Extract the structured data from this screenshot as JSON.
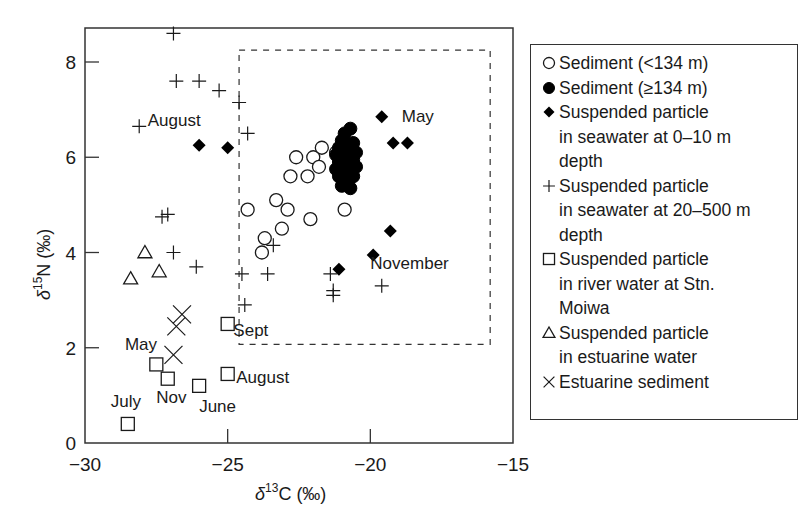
{
  "chart_data": {
    "type": "scatter",
    "title": "",
    "xlabel": "δ13C (‰)",
    "ylabel": "δ15N (‰)",
    "xlim": [
      -30,
      -15
    ],
    "ylim": [
      0,
      8.7
    ],
    "xticks": [
      -30,
      -25,
      -20,
      -15
    ],
    "yticks": [
      0,
      2,
      4,
      6,
      8
    ],
    "grid": false,
    "legend_position": "right, outside plot",
    "highlight_box": {
      "x": [
        -24.6,
        -15.8
      ],
      "y": [
        2.07,
        8.25
      ],
      "style": "dashed"
    },
    "series": [
      {
        "name": "Sediment (<134 m)",
        "marker": "open-circle",
        "points": [
          [
            -22.6,
            6.0
          ],
          [
            -22.0,
            6.0
          ],
          [
            -21.7,
            6.2
          ],
          [
            -21.2,
            6.1
          ],
          [
            -22.8,
            5.6
          ],
          [
            -22.2,
            5.6
          ],
          [
            -21.8,
            5.8
          ],
          [
            -21.0,
            5.9
          ],
          [
            -24.3,
            4.9
          ],
          [
            -23.3,
            5.1
          ],
          [
            -22.9,
            4.9
          ],
          [
            -23.7,
            4.3
          ],
          [
            -23.1,
            4.5
          ],
          [
            -23.8,
            4.0
          ],
          [
            -22.1,
            4.7
          ],
          [
            -20.9,
            4.9
          ]
        ]
      },
      {
        "name": "Sediment (≥134 m)",
        "marker": "filled-circle",
        "points": [
          [
            -20.7,
            6.6
          ],
          [
            -20.9,
            6.5
          ],
          [
            -21.0,
            6.35
          ],
          [
            -20.6,
            6.3
          ],
          [
            -21.1,
            6.2
          ],
          [
            -20.8,
            6.2
          ],
          [
            -20.5,
            6.1
          ],
          [
            -21.2,
            6.05
          ],
          [
            -20.9,
            6.0
          ],
          [
            -20.6,
            5.95
          ],
          [
            -21.1,
            5.9
          ],
          [
            -20.8,
            5.85
          ],
          [
            -20.5,
            5.8
          ],
          [
            -21.2,
            5.75
          ],
          [
            -20.9,
            5.7
          ],
          [
            -20.6,
            5.6
          ],
          [
            -21.1,
            5.6
          ],
          [
            -20.8,
            5.5
          ],
          [
            -21.0,
            5.4
          ],
          [
            -20.7,
            5.35
          ]
        ]
      },
      {
        "name": "Suspended particle in seawater at 0–10 m depth",
        "marker": "filled-diamond",
        "points": [
          [
            -26.0,
            6.25
          ],
          [
            -25.0,
            6.2
          ],
          [
            -19.6,
            6.85
          ],
          [
            -19.2,
            6.3
          ],
          [
            -18.7,
            6.3
          ],
          [
            -21.1,
            3.65
          ],
          [
            -19.9,
            3.95
          ],
          [
            -19.3,
            4.45
          ]
        ]
      },
      {
        "name": "Suspended particle in seawater at 20–500 m depth",
        "marker": "plus",
        "points": [
          [
            -26.9,
            8.6
          ],
          [
            -26.8,
            7.6
          ],
          [
            -26.0,
            7.6
          ],
          [
            -25.3,
            7.4
          ],
          [
            -24.6,
            7.15
          ],
          [
            -28.1,
            6.65
          ],
          [
            -24.3,
            6.5
          ],
          [
            -27.3,
            4.75
          ],
          [
            -27.1,
            4.8
          ],
          [
            -26.9,
            4.0
          ],
          [
            -26.1,
            3.7
          ],
          [
            -24.5,
            3.55
          ],
          [
            -23.6,
            3.55
          ],
          [
            -23.4,
            4.15
          ],
          [
            -24.4,
            2.9
          ],
          [
            -21.4,
            3.55
          ],
          [
            -21.3,
            3.2
          ],
          [
            -21.3,
            3.1
          ],
          [
            -19.6,
            3.3
          ]
        ]
      },
      {
        "name": "Suspended particle in river water at Stn. Moiwa",
        "marker": "open-square",
        "points": [
          {
            "x": -28.5,
            "y": 0.4,
            "label": "July"
          },
          {
            "x": -27.5,
            "y": 1.65,
            "label": "May"
          },
          {
            "x": -27.1,
            "y": 1.35,
            "label": "Nov"
          },
          {
            "x": -26.0,
            "y": 1.2,
            "label": "June"
          },
          {
            "x": -25.0,
            "y": 1.45,
            "label": "August"
          },
          {
            "x": -25.0,
            "y": 2.5,
            "label": "Sept"
          }
        ]
      },
      {
        "name": "Suspended particle in estuarine water",
        "marker": "open-triangle",
        "points": [
          [
            -28.4,
            3.45
          ],
          [
            -27.9,
            4.0
          ],
          [
            -27.4,
            3.6
          ]
        ]
      },
      {
        "name": "Estuarine sediment",
        "marker": "x",
        "points": [
          [
            -26.6,
            2.7
          ],
          [
            -26.8,
            2.45
          ],
          [
            -26.9,
            1.85
          ]
        ]
      }
    ],
    "annotations": [
      {
        "text": "August",
        "x": -27.8,
        "y": 6.65
      },
      {
        "text": "May",
        "x": -18.9,
        "y": 6.75
      },
      {
        "text": "November",
        "x": -20.0,
        "y": 3.65
      },
      {
        "text": "Sept",
        "x": -24.8,
        "y": 2.25
      },
      {
        "text": "May",
        "x": -28.6,
        "y": 1.95
      },
      {
        "text": "August",
        "x": -24.7,
        "y": 1.25
      },
      {
        "text": "Nov",
        "x": -27.5,
        "y": 0.85
      },
      {
        "text": "June",
        "x": -26.0,
        "y": 0.65
      },
      {
        "text": "July",
        "x": -29.1,
        "y": 0.75
      }
    ]
  },
  "axes": {
    "x_tick_labels": [
      "−30",
      "−25",
      "−20",
      "−15"
    ],
    "y_tick_labels": [
      "0",
      "2",
      "4",
      "6",
      "8"
    ],
    "x_title_main": "δ",
    "x_title_sup": "13",
    "x_title_rest": "C (‰)",
    "y_title_main": "δ",
    "y_title_sup": "15",
    "y_title_rest": "N (‰)"
  },
  "legend": {
    "items": [
      {
        "symbol": "open-circle",
        "label": "Sediment (<134 m)"
      },
      {
        "symbol": "filled-circle",
        "label": "Sediment (≥134 m)"
      },
      {
        "symbol": "filled-diamond",
        "label": "Suspended particle\nin seawater at 0–10 m\ndepth"
      },
      {
        "symbol": "plus",
        "label": "Suspended particle\nin seawater at 20–500 m\ndepth"
      },
      {
        "symbol": "open-square",
        "label": "Suspended particle\nin river water at Stn.\nMoiwa"
      },
      {
        "symbol": "open-triangle",
        "label": "Suspended particle\nin estuarine water"
      },
      {
        "symbol": "x",
        "label": "Estuarine sediment"
      }
    ]
  },
  "colors": {
    "ink": "#1a1a1a",
    "background": "#ffffff"
  }
}
